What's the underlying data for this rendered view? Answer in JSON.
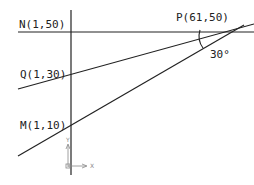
{
  "diagram": {
    "points": {
      "N": {
        "label": "N(1,50)",
        "x": 1,
        "y": 50
      },
      "Q": {
        "label": "Q(1,30)",
        "x": 1,
        "y": 30
      },
      "M": {
        "label": "M(1,10)",
        "x": 1,
        "y": 10
      },
      "P": {
        "label": "P(61,50)",
        "x": 61,
        "y": 50
      }
    },
    "angle": {
      "label": "30°"
    },
    "ucs": {
      "x_label": "X",
      "y_label": "Y"
    },
    "colors": {
      "line": "#222222",
      "ucs": "#888888"
    }
  }
}
